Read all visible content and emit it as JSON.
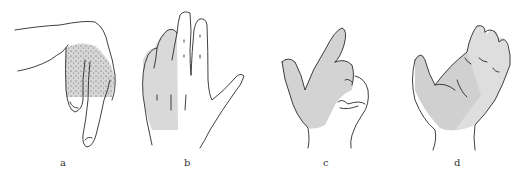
{
  "figure": {
    "panels": [
      {
        "id": "a",
        "label": "a",
        "subject": "hand-side-view-thumb-and-index-dotted-shading",
        "shading": "stippled",
        "shade_color": "#d6d6d6"
      },
      {
        "id": "b",
        "label": "b",
        "subject": "hand-dorsal-view-fingers-extended-ulnar-side-shaded",
        "shading": "flat",
        "shade_color": "#d9d9d9"
      },
      {
        "id": "c",
        "label": "c",
        "subject": "hand-pointing-radial-side-shaded",
        "shading": "flat",
        "shade_color": "#d3d3d3"
      },
      {
        "id": "d",
        "label": "d",
        "subject": "hand-palm-up-two-tone-shading",
        "shading": "two-tone",
        "shade_color": "#d0d0d0",
        "shade_color_2": "#dedede"
      }
    ],
    "colors": {
      "background": "#ffffff",
      "outline": "#2a2a2a"
    }
  }
}
